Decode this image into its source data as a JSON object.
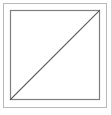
{
  "figure": {
    "canvas": {
      "width": 111,
      "height": 115,
      "background_color": "#ffffff"
    },
    "shapes": {
      "outer_frame": {
        "name": "outer-frame",
        "type": "rectangle",
        "x": 3.5,
        "y": 3.5,
        "width": 103,
        "height": 104,
        "stroke_color": "#b9b9b9",
        "stroke_width": 1,
        "fill": "none"
      },
      "inner_square": {
        "name": "inner-square",
        "type": "rectangle",
        "x": 10.5,
        "y": 10.5,
        "width": 89,
        "height": 89,
        "stroke_color": "#7f7f7f",
        "stroke_width": 1.2,
        "fill": "none"
      },
      "diagonal": {
        "name": "diagonal-line",
        "type": "line",
        "x1": 10.5,
        "y1": 99.5,
        "x2": 99.5,
        "y2": 10.5,
        "stroke_color": "#555555",
        "stroke_width": 1.1,
        "direction": "bottom-left-to-top-right"
      }
    },
    "regions": {
      "upper_left_triangle_fill": "#ffffff",
      "lower_right_triangle_fill": "#ffffff"
    }
  }
}
